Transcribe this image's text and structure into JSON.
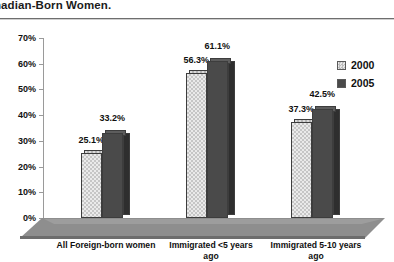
{
  "title": "nadian-Born Women.",
  "chart_data": {
    "type": "bar",
    "title": "nadian-Born Women.",
    "xlabel": "",
    "ylabel": "",
    "ylim": [
      0,
      70
    ],
    "ytick_labels": [
      "0%",
      "10%",
      "20%",
      "30%",
      "40%",
      "50%",
      "60%",
      "70%"
    ],
    "ytick_values": [
      0,
      10,
      20,
      30,
      40,
      50,
      60,
      70
    ],
    "grid": false,
    "legend_position": "top-right",
    "categories": [
      "All Foreign-born women",
      "Immigrated <5 years ago",
      "Immigrated 5-10 years ago"
    ],
    "series": [
      {
        "name": "2000",
        "color": "#d8d8d8",
        "values": [
          25.1,
          56.3,
          37.3
        ],
        "labels": [
          "25.1%",
          "56.3%",
          "37.3%"
        ]
      },
      {
        "name": "2005",
        "color": "#4a4a4a",
        "values": [
          33.2,
          61.1,
          42.5
        ],
        "labels": [
          "33.2%",
          "61.1%",
          "42.5%"
        ]
      }
    ]
  },
  "legend": {
    "items": [
      {
        "label": "2000",
        "swatch": "light-hatched-swatch"
      },
      {
        "label": "2005",
        "swatch": "dark-solid-swatch"
      }
    ]
  },
  "axis": {
    "y_labels": [
      "70%",
      "60%",
      "50%",
      "40%",
      "30%",
      "20%",
      "10%",
      "0%"
    ]
  },
  "categories": [
    {
      "line1": "All Foreign-born women",
      "line2": ""
    },
    {
      "line1": "Immigrated <5 years",
      "line2": "ago"
    },
    {
      "line1": "Immigrated 5-10 years",
      "line2": "ago"
    }
  ]
}
